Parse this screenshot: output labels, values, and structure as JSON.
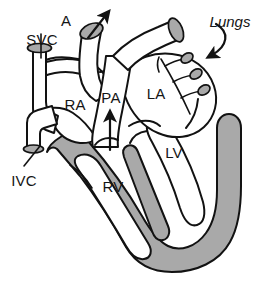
{
  "figure": {
    "background_color": "#ffffff",
    "ink_color": "#121212",
    "muscle_color": "#a9a9a9",
    "chamber_color": "#ffffff",
    "width": 271,
    "height": 291
  },
  "labels": {
    "aorta": "A",
    "superior_vena_cava": "SVC",
    "inferior_vena_cava": "IVC",
    "right_atrium": "RA",
    "pulmonary_artery": "PA",
    "left_atrium": "LA",
    "left_ventricle": "LV",
    "right_ventricle": "RV",
    "lungs": "Lungs"
  },
  "annotations": {
    "aorta_outflow_arrow": "arrow pointing up-right out of aorta",
    "pulmonary_flow_arrow": "arrow pointing up through pulmonary artery",
    "lungs_pointer_arrow": "curved arrow pointing to pulmonary vessels",
    "svc_leader": "leader line from SVC label to vessel",
    "ivc_leader": "leader line from IVC label to vessel"
  }
}
